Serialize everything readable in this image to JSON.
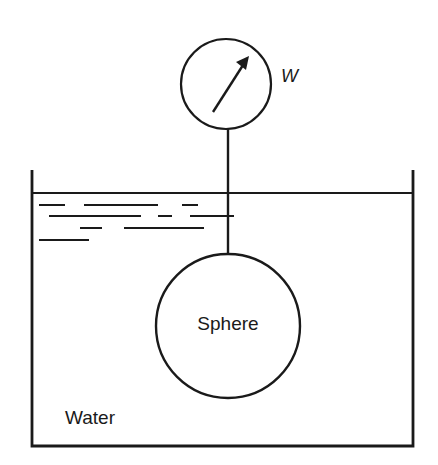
{
  "diagram": {
    "labels": {
      "gauge": "W",
      "sphere": "Sphere",
      "fluid": "Water"
    },
    "colors": {
      "stroke": "#1a1a1a",
      "background": "#ffffff"
    },
    "elements": [
      {
        "id": "spring-scale",
        "description": "circular gauge with needle arrow, labeled W"
      },
      {
        "id": "rod",
        "description": "vertical line connecting gauge to sphere"
      },
      {
        "id": "sphere",
        "description": "circle labeled Sphere, submerged in water"
      },
      {
        "id": "container",
        "description": "open-top tank filled with water"
      },
      {
        "id": "water-surface-hatching",
        "description": "horizontal dashes indicating water surface"
      }
    ]
  }
}
